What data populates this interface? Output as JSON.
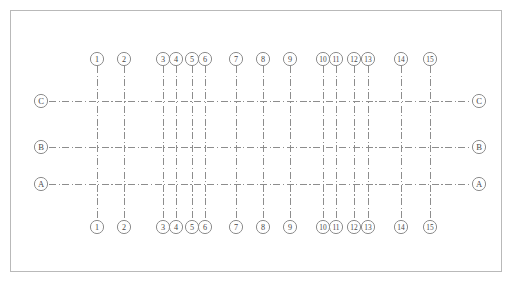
{
  "drawing": {
    "type": "architectural-structural-grid-plan",
    "canvas": {
      "width": 513,
      "height": 289
    },
    "border": {
      "x": 10,
      "y": 10,
      "width": 492,
      "height": 262,
      "color": "#b9b9b9"
    },
    "line_style": {
      "pattern": "dash-dot",
      "color": "#8d8d8d",
      "width": 1
    },
    "bubble_style": {
      "radius": 6.6,
      "fill": "#ffffff",
      "stroke": "#8d8d8d"
    },
    "column_grid": {
      "label_top_y": 59,
      "label_bottom_y": 227,
      "line_top_y": 66,
      "line_bottom_y": 220,
      "axes": [
        {
          "label": "1",
          "x": 97
        },
        {
          "label": "2",
          "x": 124
        },
        {
          "label": "3",
          "x": 163
        },
        {
          "label": "4",
          "x": 176
        },
        {
          "label": "5",
          "x": 192
        },
        {
          "label": "6",
          "x": 205
        },
        {
          "label": "7",
          "x": 236
        },
        {
          "label": "8",
          "x": 263
        },
        {
          "label": "9",
          "x": 290
        },
        {
          "label": "10",
          "x": 323
        },
        {
          "label": "11",
          "x": 336
        },
        {
          "label": "12",
          "x": 354
        },
        {
          "label": "13",
          "x": 368
        },
        {
          "label": "14",
          "x": 401
        },
        {
          "label": "15",
          "x": 430
        }
      ]
    },
    "row_grid": {
      "label_left_x": 41,
      "label_right_x": 479,
      "line_left_x": 49,
      "line_right_x": 471,
      "axes": [
        {
          "label": "C",
          "y": 101
        },
        {
          "label": "B",
          "y": 147
        },
        {
          "label": "A",
          "y": 184
        }
      ]
    }
  }
}
